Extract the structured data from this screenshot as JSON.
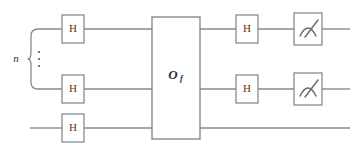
{
  "figure": {
    "kind": "quantum-circuit-diagram",
    "background_color": "#ffffff",
    "line_color": "#8a8a8a",
    "text_color": "#2e2e2e"
  },
  "register_label": {
    "text": "n",
    "description": "italic n labelling the n-qubit register brace"
  },
  "vertical_ellipsis": {
    "text": "⋮",
    "description": "vertical dots indicating omitted qubit wires"
  },
  "oracle": {
    "label_main": "O",
    "label_subscript": "f",
    "full_label": "Of"
  },
  "gates": {
    "hadamard_label": "H",
    "measure_label": "measure"
  },
  "wires": [
    {
      "name": "wire-1",
      "in_register": true,
      "gates": [
        "H",
        "Of",
        "H",
        "measure"
      ]
    },
    {
      "name": "wire-2",
      "in_register": true,
      "gates": [
        "H",
        "Of",
        "H",
        "measure"
      ]
    },
    {
      "name": "wire-3",
      "in_register": false,
      "gates": [
        "H",
        "Of"
      ]
    }
  ],
  "layout": {
    "wire_y": [
      29,
      89,
      128
    ],
    "wire_start_x": [
      59,
      59,
      30
    ],
    "wire_end_x": 350,
    "h_left_x": 62,
    "h_right_x": 236,
    "oracle_x": 152,
    "oracle_w": 48,
    "oracle_y": 17,
    "oracle_h": 122,
    "measure_x": 294,
    "gate_w": 22,
    "gate_h": 28,
    "brace_tip_x": 28,
    "brace_top_y": 29,
    "brace_bottom_y": 89,
    "n_label_x": 16,
    "ellipsis_x": 38
  }
}
